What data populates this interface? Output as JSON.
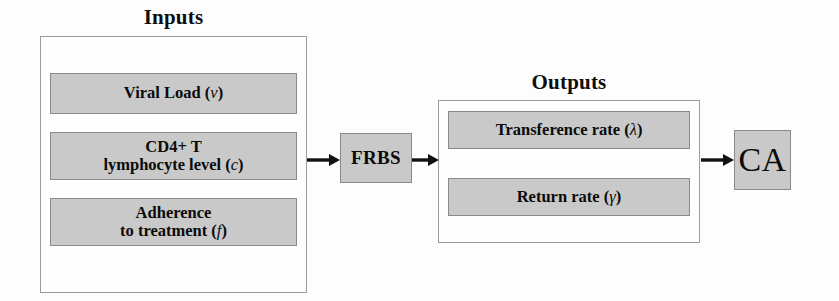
{
  "diagram": {
    "colors": {
      "box_fill": "#c9c9c9",
      "box_border": "#8a8a8a",
      "group_border": "#9b9b9b",
      "background": "#fdfdfd",
      "text": "#0b0b0b",
      "arrow": "#111111"
    }
  },
  "inputs": {
    "title": "Inputs",
    "items": [
      {
        "line1": "Viral Load",
        "line2": "",
        "symbol": "v"
      },
      {
        "line1": "CD4+ T",
        "line2": "lymphocyte level",
        "symbol": "c"
      },
      {
        "line1": "Adherence",
        "line2": "to treatment",
        "symbol": "f"
      }
    ]
  },
  "processor": {
    "label": "FRBS"
  },
  "outputs": {
    "title": "Outputs",
    "items": [
      {
        "line1": "Transference rate",
        "line2": "",
        "symbol": "λ"
      },
      {
        "line1": "Return rate",
        "line2": "",
        "symbol": "γ"
      }
    ]
  },
  "terminal": {
    "label": "CA"
  },
  "arrows": [
    {
      "name": "inputs-to-frbs",
      "from": "inputs",
      "to": "processor"
    },
    {
      "name": "frbs-to-outputs",
      "from": "processor",
      "to": "outputs"
    },
    {
      "name": "outputs-to-ca",
      "from": "outputs",
      "to": "terminal"
    }
  ]
}
